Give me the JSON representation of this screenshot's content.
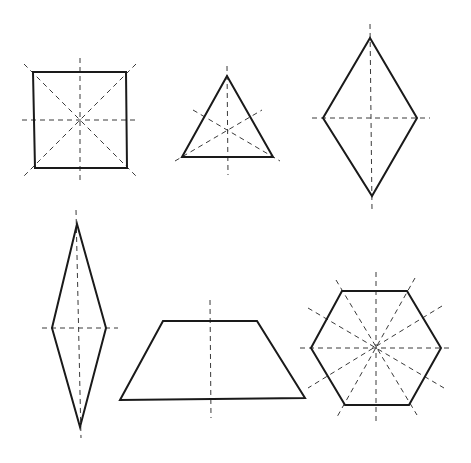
{
  "diagram": {
    "background": "#ffffff",
    "stroke_color": "#1a1a1a",
    "axis_color": "#3a3a3a",
    "shapes": [
      {
        "id": "square",
        "name": "Square",
        "lines_of_symmetry": 4,
        "points": [
          [
            33,
            72
          ],
          [
            126,
            72
          ],
          [
            127,
            168
          ],
          [
            35,
            168
          ]
        ],
        "axes": [
          [
            80,
            58,
            80,
            182
          ],
          [
            22,
            120,
            138,
            120
          ],
          [
            24,
            64,
            136,
            176
          ],
          [
            136,
            64,
            24,
            176
          ]
        ]
      },
      {
        "id": "equilateral-triangle",
        "name": "Equilateral triangle",
        "lines_of_symmetry": 3,
        "points": [
          [
            227,
            76
          ],
          [
            182,
            157
          ],
          [
            273,
            157
          ]
        ],
        "axes": [
          [
            227,
            66,
            228,
            175
          ],
          [
            175,
            161,
            262,
            110
          ],
          [
            193,
            110,
            280,
            161
          ]
        ]
      },
      {
        "id": "rhombus",
        "name": "Rhombus",
        "lines_of_symmetry": 2,
        "points": [
          [
            370,
            38
          ],
          [
            417,
            118
          ],
          [
            372,
            196
          ],
          [
            323,
            118
          ]
        ],
        "axes": [
          [
            370,
            24,
            372,
            210
          ],
          [
            312,
            118,
            430,
            118
          ]
        ]
      },
      {
        "id": "tall-rhombus",
        "name": "Tall rhombus",
        "lines_of_symmetry": 2,
        "points": [
          [
            77,
            224
          ],
          [
            106,
            328
          ],
          [
            80,
            427
          ],
          [
            52,
            328
          ]
        ],
        "axes": [
          [
            76,
            210,
            81,
            438
          ],
          [
            42,
            328,
            118,
            328
          ]
        ]
      },
      {
        "id": "isosceles-trapezoid",
        "name": "Isosceles trapezoid",
        "lines_of_symmetry": 1,
        "points": [
          [
            163,
            321
          ],
          [
            257,
            321
          ],
          [
            305,
            398
          ],
          [
            120,
            400
          ]
        ],
        "axes": [
          [
            210,
            300,
            211,
            418
          ]
        ]
      },
      {
        "id": "regular-hexagon",
        "name": "Regular hexagon",
        "lines_of_symmetry": 6,
        "points": [
          [
            342,
            291
          ],
          [
            407,
            291
          ],
          [
            441,
            348
          ],
          [
            409,
            405
          ],
          [
            345,
            405
          ],
          [
            311,
            348
          ]
        ],
        "axes": [
          [
            376,
            272,
            376,
            425
          ],
          [
            300,
            348,
            452,
            348
          ],
          [
            336,
            280,
            417,
            415
          ],
          [
            415,
            278,
            337,
            417
          ],
          [
            308,
            308,
            444,
            388
          ],
          [
            442,
            306,
            308,
            388
          ]
        ]
      }
    ]
  }
}
